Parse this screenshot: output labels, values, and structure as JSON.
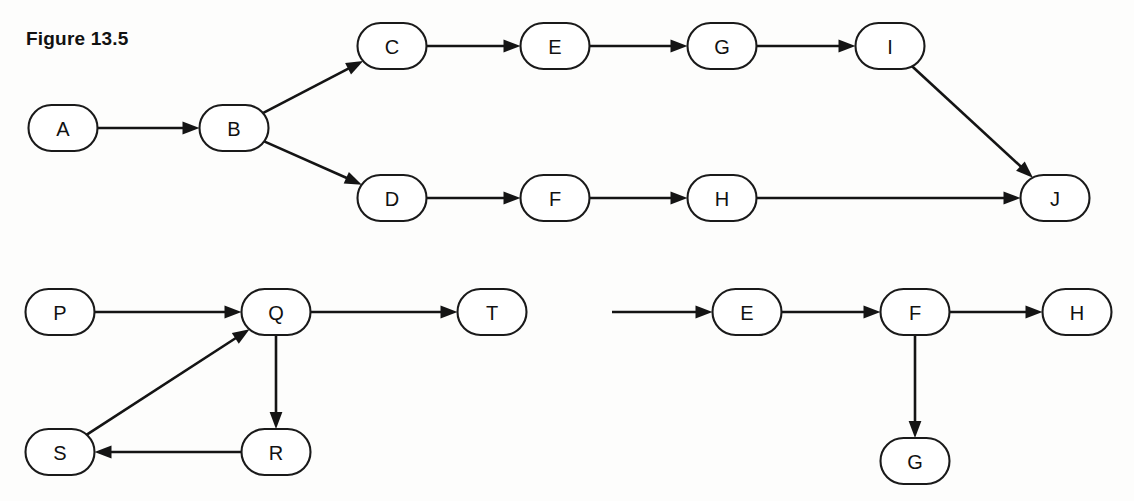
{
  "figure": {
    "caption": "Figure 13.5",
    "background_color": "#fdfdfc",
    "ink_color": "#141414",
    "node_fill": "#ffffff"
  },
  "chart_data": {
    "type": "diagram",
    "diagram_kind": "directed-graph",
    "title": "Figure 13.5",
    "node_shape": "stadium",
    "node_width": 69,
    "node_height": 46,
    "panels": [
      {
        "id": "panel-top",
        "name": "top-graph",
        "nodes": [
          {
            "id": "A",
            "label": "A",
            "cx": 63,
            "cy": 128
          },
          {
            "id": "B",
            "label": "B",
            "cx": 234,
            "cy": 128
          },
          {
            "id": "C",
            "label": "C",
            "cx": 392,
            "cy": 46
          },
          {
            "id": "E",
            "label": "E",
            "cx": 555,
            "cy": 46
          },
          {
            "id": "G",
            "label": "G",
            "cx": 722,
            "cy": 46
          },
          {
            "id": "I",
            "label": "I",
            "cx": 890,
            "cy": 46
          },
          {
            "id": "D",
            "label": "D",
            "cx": 392,
            "cy": 198
          },
          {
            "id": "F",
            "label": "F",
            "cx": 555,
            "cy": 198
          },
          {
            "id": "H",
            "label": "H",
            "cx": 722,
            "cy": 198
          },
          {
            "id": "J",
            "label": "J",
            "cx": 1055,
            "cy": 198
          }
        ],
        "edges": [
          {
            "from": "A",
            "to": "B"
          },
          {
            "from": "B",
            "to": "C"
          },
          {
            "from": "C",
            "to": "E"
          },
          {
            "from": "E",
            "to": "G"
          },
          {
            "from": "G",
            "to": "I"
          },
          {
            "from": "I",
            "to": "J"
          },
          {
            "from": "B",
            "to": "D"
          },
          {
            "from": "D",
            "to": "F"
          },
          {
            "from": "F",
            "to": "H"
          },
          {
            "from": "H",
            "to": "J"
          }
        ]
      },
      {
        "id": "panel-bottom-left",
        "name": "bottom-left-graph",
        "nodes": [
          {
            "id": "P",
            "label": "P",
            "cx": 60,
            "cy": 312
          },
          {
            "id": "Q",
            "label": "Q",
            "cx": 276,
            "cy": 312
          },
          {
            "id": "T",
            "label": "T",
            "cx": 492,
            "cy": 312
          },
          {
            "id": "R",
            "label": "R",
            "cx": 276,
            "cy": 452
          },
          {
            "id": "S",
            "label": "S",
            "cx": 60,
            "cy": 452
          }
        ],
        "edges": [
          {
            "from": "P",
            "to": "Q"
          },
          {
            "from": "Q",
            "to": "T"
          },
          {
            "from": "Q",
            "to": "R"
          },
          {
            "from": "R",
            "to": "S"
          },
          {
            "from": "S",
            "to": "Q"
          }
        ]
      },
      {
        "id": "panel-bottom-right",
        "name": "bottom-right-graph",
        "nodes": [
          {
            "id": "E2",
            "label": "E",
            "cx": 747,
            "cy": 312
          },
          {
            "id": "F2",
            "label": "F",
            "cx": 915,
            "cy": 312
          },
          {
            "id": "H2",
            "label": "H",
            "cx": 1077,
            "cy": 312
          },
          {
            "id": "G2",
            "label": "G",
            "cx": 915,
            "cy": 461
          }
        ],
        "edges": [
          {
            "from": "E2",
            "to": "F2"
          },
          {
            "from": "F2",
            "to": "H2"
          },
          {
            "from": "F2",
            "to": "G2"
          }
        ],
        "dangling_edges": [
          {
            "to": "E2",
            "from_x": 612,
            "from_y": 312
          }
        ]
      }
    ]
  }
}
